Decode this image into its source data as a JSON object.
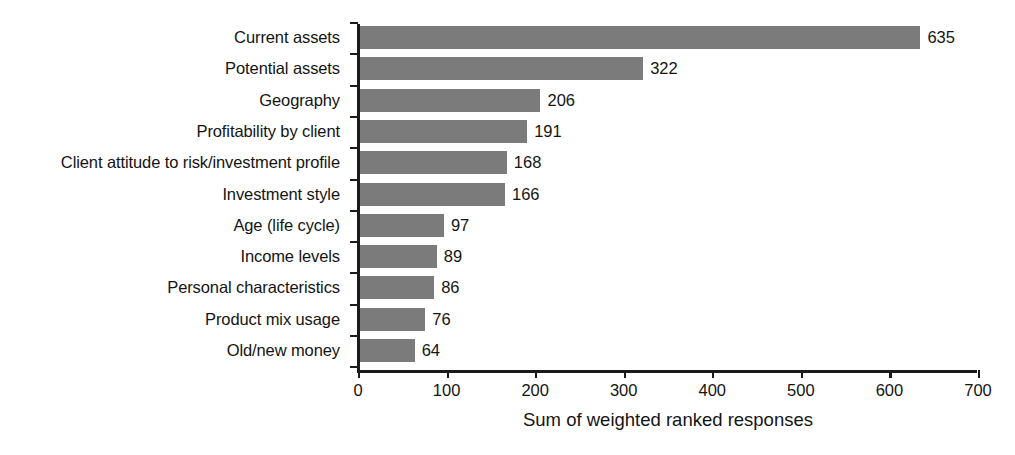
{
  "chart_data": {
    "type": "bar",
    "orientation": "horizontal",
    "title": "",
    "xlabel": "Sum of weighted ranked responses",
    "ylabel": "",
    "xlim": [
      0,
      700
    ],
    "xticks": [
      0,
      100,
      200,
      300,
      400,
      500,
      600,
      700
    ],
    "xtick_labels": [
      "0",
      "100",
      "200",
      "300",
      "400",
      "500",
      "600",
      "700"
    ],
    "grid": false,
    "legend": false,
    "bar_color": "#7b7b7b",
    "axis_color": "#1b1b1b",
    "text_color": "#141414",
    "background_color": "#ffffff",
    "categories": [
      "Current assets",
      "Potential assets",
      "Geography",
      "Profitability by client",
      "Client attitude to risk/investment profile",
      "Investment style",
      "Age (life cycle)",
      "Income levels",
      "Personal characteristics",
      "Product mix usage",
      "Old/new money"
    ],
    "values": [
      635,
      322,
      206,
      191,
      168,
      166,
      97,
      89,
      86,
      76,
      64
    ],
    "value_labels": [
      "635",
      "322",
      "206",
      "191",
      "168",
      "166",
      "97",
      "89",
      "86",
      "76",
      "64"
    ]
  }
}
